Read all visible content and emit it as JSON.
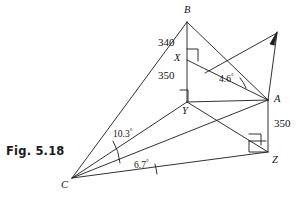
{
  "figure": {
    "caption": "Fig. 5.18",
    "stroke_color": "#1a1a1a",
    "background_color": "#ffffff"
  },
  "points": {
    "B": {
      "label": "B",
      "x": 187,
      "y": 22
    },
    "X": {
      "label": "X",
      "x": 187,
      "y": 60
    },
    "Y": {
      "label": "Y",
      "x": 187,
      "y": 102
    },
    "A": {
      "label": "A",
      "x": 268,
      "y": 100
    },
    "Z": {
      "label": "Z",
      "x": 268,
      "y": 152
    },
    "C": {
      "label": "C",
      "x": 72,
      "y": 178
    }
  },
  "lengths": {
    "BX": "340",
    "XY": "350",
    "AZ": "350"
  },
  "angles": {
    "at_C_upper": "10.3",
    "at_C_lower": "6.7",
    "at_A": "4.6",
    "degree_symbol": "°"
  },
  "right_angles": [
    {
      "name": "right-angle-at-X",
      "vertex": "X"
    },
    {
      "name": "right-angle-at-Y",
      "vertex": "Y"
    },
    {
      "name": "right-angle-at-Z-upper",
      "vertex": "Z"
    },
    {
      "name": "right-angle-at-Z-lower",
      "vertex": "Z"
    }
  ]
}
